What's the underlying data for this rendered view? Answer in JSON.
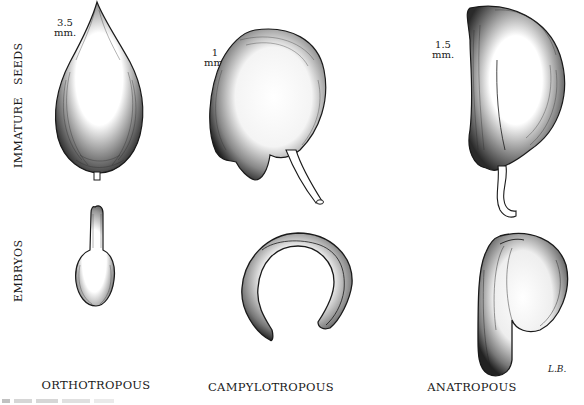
{
  "figure": {
    "row_labels": {
      "top": "IMMATURE   SEEDS",
      "bottom": "EMBRYOS"
    },
    "columns": [
      {
        "label": "ORTHOTROPOUS",
        "scale": [
          "3.5",
          "mm."
        ]
      },
      {
        "label": "CAMPYLOTROPOUS",
        "scale": [
          "1",
          "mm."
        ]
      },
      {
        "label": "ANATROPOUS",
        "scale": [
          "1.5",
          "mm."
        ]
      }
    ],
    "signature": "L.B.",
    "caption": "Figure ... (partially cropped)"
  },
  "colors": {
    "ink": "#1a1a1a",
    "background": "#ffffff"
  }
}
